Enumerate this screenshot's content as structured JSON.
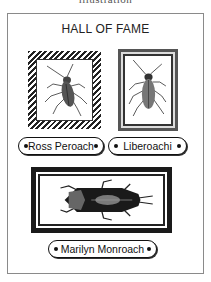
{
  "header": {
    "cutoff_text": "illustration",
    "title": "HALL OF FAME"
  },
  "inductees": [
    {
      "name": "Ross Peroach",
      "frame": "striped",
      "icon": "cockroach-icon"
    },
    {
      "name": "Liberoachi",
      "frame": "double",
      "icon": "cockroach-icon"
    },
    {
      "name": "Marilyn Monroach",
      "frame": "wide-black",
      "icon": "cockroach-icon"
    }
  ],
  "colors": {
    "ink": "#111111",
    "border": "#8a8a8a",
    "background": "#ffffff"
  }
}
